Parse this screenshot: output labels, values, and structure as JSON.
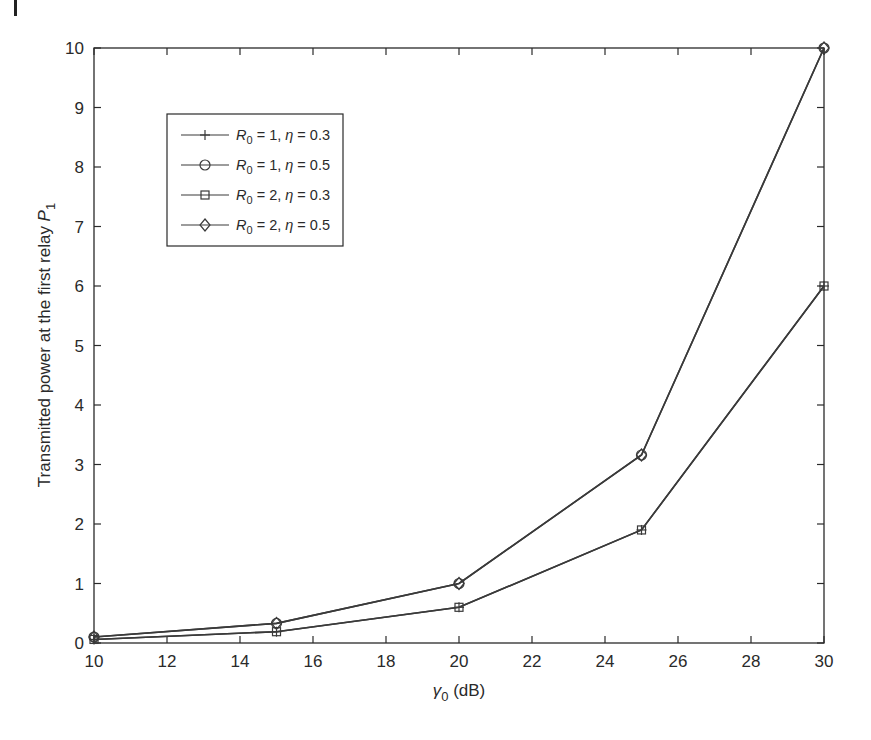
{
  "chart_data": {
    "type": "line",
    "title": "",
    "xlabel": "γ0 (dB)",
    "xlabel_parts": {
      "symbol": "γ",
      "subscript": "0",
      "unit": " (dB)"
    },
    "ylabel": "Transmitted power at the first relay P1",
    "ylabel_parts": {
      "text": "Transmitted power at the first relay ",
      "symbol": "P",
      "subscript": "1"
    },
    "x": [
      10,
      15,
      20,
      25,
      30
    ],
    "xlim": [
      10,
      30
    ],
    "ylim": [
      0,
      10
    ],
    "xticks": [
      10,
      12,
      14,
      16,
      18,
      20,
      22,
      24,
      26,
      28,
      30
    ],
    "yticks": [
      0,
      1,
      2,
      3,
      4,
      5,
      6,
      7,
      8,
      9,
      10
    ],
    "grid": false,
    "legend_position": "upper left",
    "series": [
      {
        "name": "R0 = 1, η = 0.3",
        "label_parts": {
          "R_sub": "0",
          "R_val": "1",
          "eta_val": "0.3"
        },
        "marker": "plus",
        "values": [
          0.06,
          0.19,
          0.6,
          1.9,
          6.0
        ]
      },
      {
        "name": "R0 = 1, η = 0.5",
        "label_parts": {
          "R_sub": "0",
          "R_val": "1",
          "eta_val": "0.5"
        },
        "marker": "circle",
        "values": [
          0.1,
          0.33,
          1.0,
          3.16,
          10.0
        ]
      },
      {
        "name": "R0 = 2, η = 0.3",
        "label_parts": {
          "R_sub": "0",
          "R_val": "2",
          "eta_val": "0.3"
        },
        "marker": "square",
        "values": [
          0.06,
          0.19,
          0.6,
          1.9,
          6.0
        ]
      },
      {
        "name": "R0 = 2, η = 0.5",
        "label_parts": {
          "R_sub": "0",
          "R_val": "2",
          "eta_val": "0.5"
        },
        "marker": "diamond",
        "values": [
          0.1,
          0.33,
          1.0,
          3.16,
          10.0
        ]
      }
    ]
  },
  "colors": {
    "line": "#3a3a3a",
    "axis": "#2a2a2a",
    "background": "#ffffff"
  },
  "legend": {
    "items": [
      {
        "R": "R",
        "sub": "0",
        "rest": " = 1, ",
        "eta": "η",
        "val": " = 0.3"
      },
      {
        "R": "R",
        "sub": "0",
        "rest": " = 1, ",
        "eta": "η",
        "val": " = 0.5"
      },
      {
        "R": "R",
        "sub": "0",
        "rest": " = 2, ",
        "eta": "η",
        "val": " = 0.3"
      },
      {
        "R": "R",
        "sub": "0",
        "rest": " = 2, ",
        "eta": "η",
        "val": " = 0.5"
      }
    ]
  }
}
